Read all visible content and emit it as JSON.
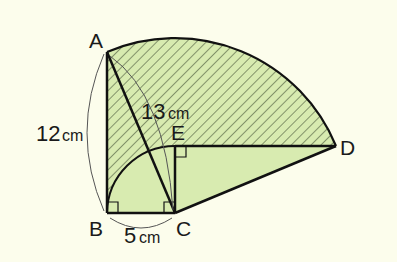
{
  "colors": {
    "background": "#fcfdec",
    "shaded_fill": "#d8ebb0",
    "hatch_line": "#3d4a30",
    "outline": "#111111",
    "dimension_line": "#555555"
  },
  "points": {
    "A": "A",
    "B": "B",
    "C": "C",
    "D": "D",
    "E": "E"
  },
  "dimensions": {
    "AB": {
      "value": "12",
      "unit": "cm"
    },
    "AC": {
      "value": "13",
      "unit": "cm"
    },
    "BC": {
      "value": "5",
      "unit": "cm"
    }
  },
  "right_angle_marks": [
    "B",
    "C (angle BCE)",
    "E (angle CED)"
  ],
  "regions": {
    "hatched": "sector region above arc BE and segment ED, bounded by arc AD",
    "solid": "region under arc BE and triangle CED"
  }
}
